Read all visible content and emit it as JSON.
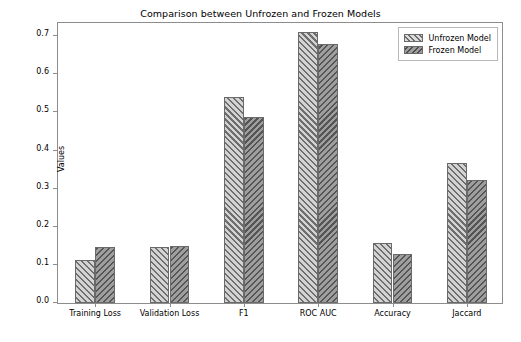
{
  "chart_data": {
    "type": "bar",
    "title": "Comparison between Unfrozen and Frozen Models",
    "xlabel": "Metrics",
    "ylabel": "Values",
    "categories": [
      "Training Loss",
      "Validation Loss",
      "F1",
      "ROC AUC",
      "Accuracy",
      "Jaccard"
    ],
    "series": [
      {
        "name": "Unfrozen Model",
        "values": [
          0.113,
          0.148,
          0.54,
          0.71,
          0.157,
          0.368
        ],
        "color": "#d3d3d3",
        "hatch": "//"
      },
      {
        "name": "Frozen Model",
        "values": [
          0.148,
          0.149,
          0.487,
          0.679,
          0.128,
          0.323
        ],
        "color": "#9e9e9e",
        "hatch": "\\\\"
      }
    ],
    "ylim": [
      0.0,
      0.74
    ],
    "yticks": [
      0.0,
      0.1,
      0.2,
      0.3,
      0.4,
      0.5,
      0.6,
      0.7
    ],
    "ytick_labels": [
      "0.0",
      "0.1",
      "0.2",
      "0.3",
      "0.4",
      "0.5",
      "0.6",
      "0.7"
    ],
    "grid": false,
    "legend_position": "upper right"
  },
  "legend": {
    "entries": [
      {
        "label": "Unfrozen Model"
      },
      {
        "label": "Frozen Model"
      }
    ]
  }
}
